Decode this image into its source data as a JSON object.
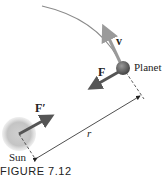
{
  "figure": {
    "caption": "FIGURE 7.12",
    "labels": {
      "velocity": "v",
      "force_on_planet": "F",
      "force_on_sun": "F′",
      "planet": "Planet",
      "sun": "Sun",
      "distance": "r"
    },
    "colors": {
      "orbit": "#8a8a8a",
      "velocity_arrow": "#9a9a9a",
      "force_arrow": "#555555",
      "sun_fill": "#c8c8c8",
      "planet_fill": "#6e6e6e",
      "text": "#222222"
    }
  }
}
